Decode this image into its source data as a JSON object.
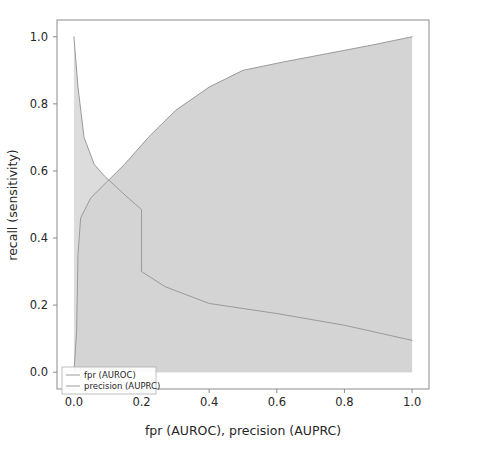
{
  "figure": {
    "background_color": "#ffffff",
    "frame_color": "#8c8c8c",
    "tick_color": "#8c8c8c",
    "text_color": "#262626"
  },
  "chart_data": {
    "type": "line",
    "title": "",
    "subtitle": "",
    "xlabel": "fpr (AUROC), precision (AUPRC)",
    "ylabel": "recall (sensitivity)",
    "xlim": [
      -0.05,
      1.05
    ],
    "ylim": [
      -0.05,
      1.05
    ],
    "grid": false,
    "legend_position": "lower left",
    "xticks": [
      0.0,
      0.2,
      0.4,
      0.6,
      0.8,
      1.0
    ],
    "xtick_labels": [
      "0.0",
      "0.2",
      "0.4",
      "0.6",
      "0.8",
      "1.0"
    ],
    "yticks": [
      0.0,
      0.2,
      0.4,
      0.6,
      0.8,
      1.0
    ],
    "ytick_labels": [
      "0.0",
      "0.2",
      "0.4",
      "0.6",
      "0.8",
      "1.0"
    ],
    "fill_color": "#d4d4d4",
    "fill_alpha": 1.0,
    "line_color": "#9a9a9a",
    "line_width": 1.0,
    "series": [
      {
        "name": "fpr (AUROC)",
        "key": "roc",
        "line_color": "#9a9a9a",
        "fill_color": "#d4d4d4",
        "x": [
          0.0,
          0.008,
          0.012,
          0.02,
          0.05,
          0.09,
          0.15,
          0.22,
          0.3,
          0.4,
          0.5,
          0.62,
          0.75,
          0.88,
          1.0
        ],
        "y": [
          0.0,
          0.12,
          0.35,
          0.46,
          0.52,
          0.56,
          0.62,
          0.7,
          0.78,
          0.85,
          0.9,
          0.925,
          0.95,
          0.975,
          1.0
        ]
      },
      {
        "name": "precision (AUPRC)",
        "key": "prc",
        "line_color": "#9a9a9a",
        "fill_color": "#dcdcdc",
        "x": [
          0.0,
          0.012,
          0.03,
          0.06,
          0.09,
          0.16,
          0.2,
          0.2,
          0.27,
          0.4,
          0.6,
          0.8,
          1.0
        ],
        "y": [
          1.0,
          0.85,
          0.7,
          0.62,
          0.585,
          0.52,
          0.485,
          0.3,
          0.255,
          0.205,
          0.175,
          0.14,
          0.095
        ]
      }
    ],
    "legend_entries": [
      {
        "label": "fpr (AUROC)",
        "color": "#9a9a9a"
      },
      {
        "label": "precision (AUPRC)",
        "color": "#9a9a9a"
      }
    ]
  }
}
